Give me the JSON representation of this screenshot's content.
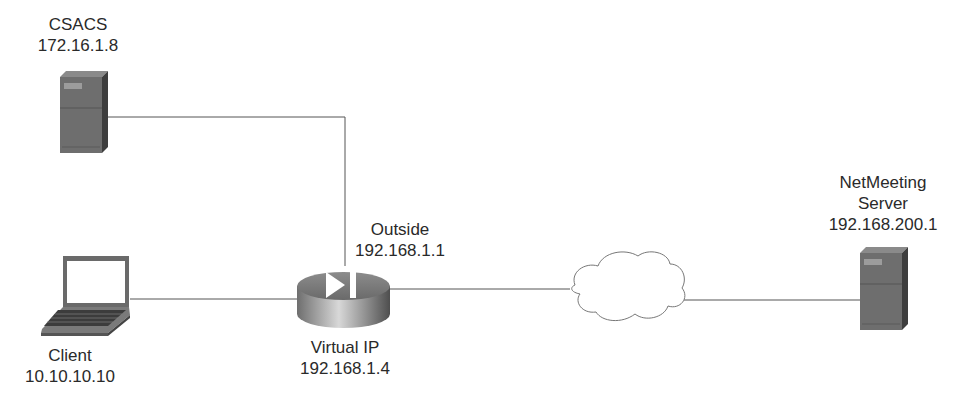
{
  "nodes": {
    "csacs": {
      "name": "CSACS",
      "ip": "172.16.1.8",
      "icon": "server-icon"
    },
    "client": {
      "name": "Client",
      "ip": "10.10.10.10",
      "icon": "laptop-icon"
    },
    "router": {
      "outside_label": "Outside",
      "outside_ip": "192.168.1.1",
      "virtual_label": "Virtual IP",
      "virtual_ip": "192.168.1.4",
      "icon": "router-icon"
    },
    "cloud": {
      "icon": "cloud-icon"
    },
    "netmeeting": {
      "name_line1": "NetMeeting",
      "name_line2": "Server",
      "ip": "192.168.200.1",
      "icon": "server-icon"
    }
  },
  "colors": {
    "line": "#555555",
    "device_dark": "#5a5a5a",
    "device_mid": "#7d7d7d",
    "device_light": "#a8a8a8"
  }
}
